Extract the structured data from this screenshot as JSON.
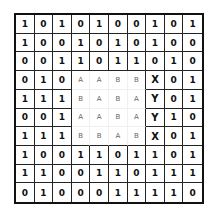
{
  "grid": {
    "rows": [
      [
        "1",
        "0",
        "1",
        "0",
        "1",
        "0",
        "0",
        "1",
        "0",
        "1"
      ],
      [
        "1",
        "0",
        "0",
        "1",
        "0",
        "1",
        "0",
        "1",
        "0",
        "0"
      ],
      [
        "0",
        "0",
        "1",
        "1",
        "0",
        "1",
        "1",
        "0",
        "1",
        "0"
      ],
      [
        "0",
        "1",
        "0",
        "A",
        "A",
        "B",
        "B",
        "X",
        "0",
        "1"
      ],
      [
        "1",
        "1",
        "1",
        "B",
        "A",
        "B",
        "A",
        "Y",
        "0",
        "1"
      ],
      [
        "0",
        "0",
        "1",
        "A",
        "A",
        "B",
        "A",
        "Y",
        "1",
        "0"
      ],
      [
        "1",
        "1",
        "1",
        "B",
        "B",
        "A",
        "B",
        "X",
        "0",
        "1"
      ],
      [
        "1",
        "0",
        "0",
        "1",
        "1",
        "0",
        "1",
        "1",
        "0",
        "1"
      ],
      [
        "1",
        "1",
        "0",
        "0",
        "1",
        "1",
        "0",
        "1",
        "1",
        "1"
      ],
      [
        "0",
        "1",
        "0",
        "0",
        "0",
        "1",
        "1",
        "1",
        "1",
        "0"
      ]
    ],
    "letter_region": {
      "row_start": 3,
      "row_end": 6,
      "col_start": 3,
      "col_end": 6
    },
    "marker_column": 7
  }
}
